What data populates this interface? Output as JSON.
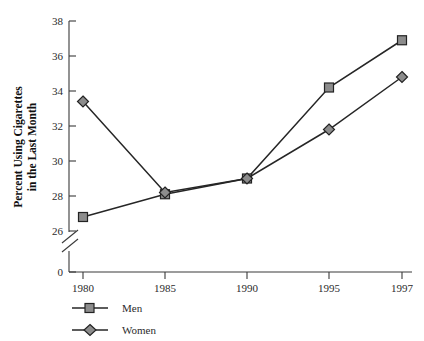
{
  "chart_data": {
    "type": "line",
    "title": "",
    "xlabel": "",
    "ylabel": "Percent Using Cigarettes in the Last Month",
    "ylabel_line1": "Percent Using Cigarettes",
    "ylabel_line2": "in the Last Month",
    "categories": [
      "1980",
      "1985",
      "1990",
      "1995",
      "1997"
    ],
    "x_tick_labels": [
      "1980",
      "1985",
      "1990",
      "1995",
      "1997"
    ],
    "y_tick_labels": [
      "0",
      "26",
      "28",
      "30",
      "32",
      "34",
      "36",
      "38"
    ],
    "ylim": [
      26,
      38
    ],
    "y_axis_break": true,
    "y_axis_break_note": "axis broken between 0 and 26",
    "grid": false,
    "legend_position": "bottom-left",
    "series": [
      {
        "name": "Men",
        "marker": "square",
        "values": [
          26.8,
          28.1,
          29.0,
          34.2,
          36.9
        ]
      },
      {
        "name": "Women",
        "marker": "diamond",
        "values": [
          33.4,
          28.2,
          29.0,
          31.8,
          34.8
        ]
      }
    ]
  },
  "legend": {
    "items": [
      {
        "label": "Men",
        "marker": "square"
      },
      {
        "label": "Women",
        "marker": "diamond"
      }
    ]
  },
  "colors": {
    "marker_fill": "#8c8c8c",
    "marker_stroke": "#232323",
    "line": "#262626",
    "axis": "#3a3a3a",
    "text": "#2b2b2b",
    "background": "#ffffff"
  }
}
